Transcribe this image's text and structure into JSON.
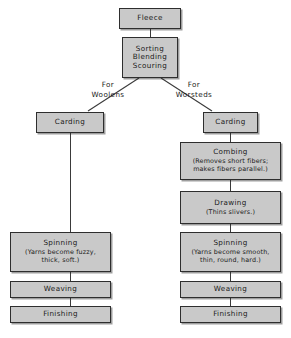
{
  "diagram": {
    "colors": {
      "box_fill": "#c9c9c9",
      "box_border": "#2e2e2e",
      "line": "#3a3a3a",
      "background": "#ffffff"
    },
    "nodes": {
      "fleece": {
        "title": "Fleece",
        "sub1": "",
        "sub2": ""
      },
      "sorting": {
        "title": "Sorting",
        "sub1": "Blending",
        "sub2": "Scouring"
      },
      "carding_woolens": {
        "title": "Carding",
        "sub1": "",
        "sub2": ""
      },
      "carding_worsteds": {
        "title": "Carding",
        "sub1": "",
        "sub2": ""
      },
      "combing": {
        "title": "Combing",
        "sub1": "(Removes short fibers;",
        "sub2": "makes fibers parallel.)"
      },
      "drawing": {
        "title": "Drawing",
        "sub1": "(Thins slivers.)",
        "sub2": ""
      },
      "spinning_woolens": {
        "title": "Spinning",
        "sub1": "(Yarns become fuzzy,",
        "sub2": "thick, soft.)"
      },
      "spinning_worsteds": {
        "title": "Spinning",
        "sub1": "(Yarns become smooth,",
        "sub2": "thin, round, hard.)"
      },
      "weaving_woolens": {
        "title": "Weaving",
        "sub1": "",
        "sub2": ""
      },
      "finishing_woolens": {
        "title": "Finishing",
        "sub1": "",
        "sub2": ""
      },
      "weaving_worsteds": {
        "title": "Weaving",
        "sub1": "",
        "sub2": ""
      },
      "finishing_worsteds": {
        "title": "Finishing",
        "sub1": "",
        "sub2": ""
      }
    },
    "branches": {
      "woolens": {
        "line1": "For",
        "line2": "Woolens"
      },
      "worsteds": {
        "line1": "For",
        "line2": "Worsteds"
      }
    }
  }
}
